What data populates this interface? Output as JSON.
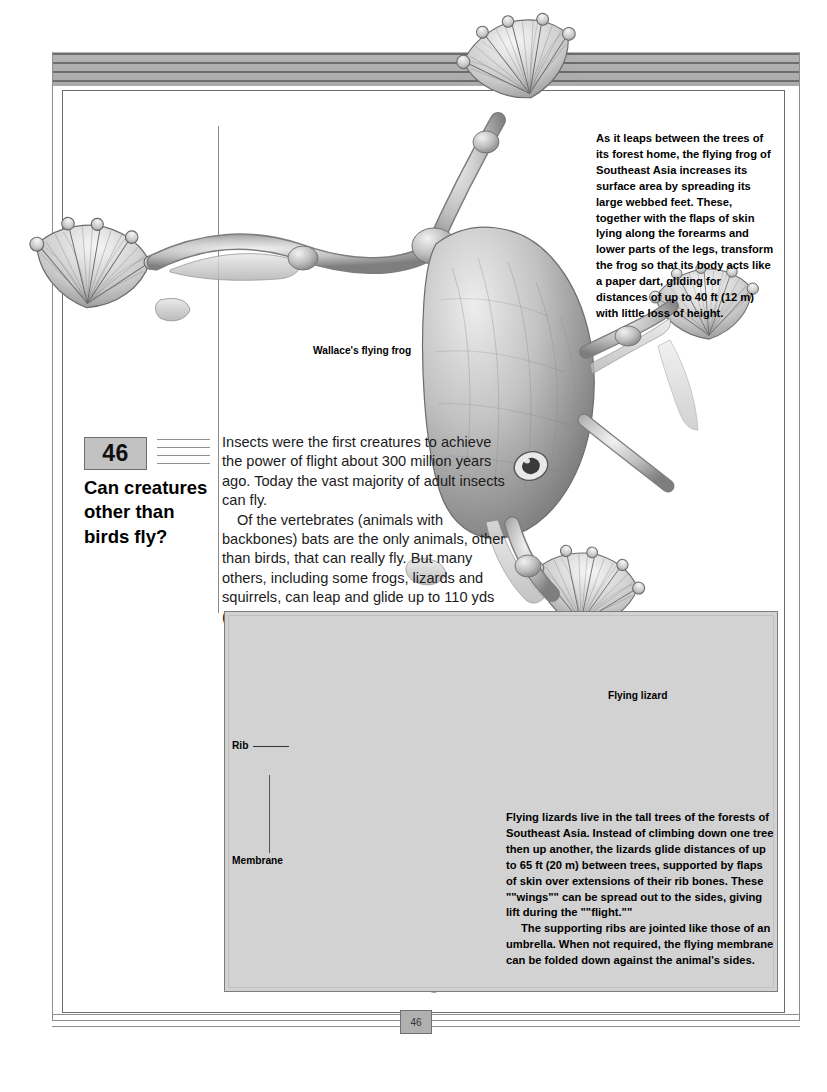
{
  "page": {
    "number": "46",
    "footer_number": "46"
  },
  "heading": {
    "number": "46",
    "title": "Can creatures other than birds fly?"
  },
  "body": {
    "paragraphs": [
      "Insects were the first creatures to achieve the power of flight about 300 million years ago. Today the vast majority of adult insects can fly.",
      "Of the vertebrates (animals with backbones) bats are the only animals, other than birds, that can really fly. But many others, including some frogs, lizards and squirrels, can leap and glide up to 110 yds (100 m)."
    ]
  },
  "frog_caption": {
    "text": "As it leaps between the trees of its forest home, the flying frog of Southeast Asia increases its surface area by spreading its large webbed feet. These, together with the flaps of skin lying along the forearms and lower parts of the legs, transform the frog so that its body acts like a paper dart, gliding for distances of up to 40 ft (12 m) with little loss of height."
  },
  "labels": {
    "frog": "Wallace's flying frog",
    "lizard": "Flying lizard",
    "rib": "Rib",
    "membrane": "Membrane"
  },
  "lizard_caption": {
    "paragraphs": [
      "Flying lizards live in the tall trees of the forests of Southeast Asia. Instead of climbing down one tree then up another, the lizards glide distances of up to 65 ft (20 m) between trees, supported by flaps of skin over extensions of their rib bones. These \"\"wings\"\" can be spread out to the sides, giving lift during the \"\"flight.\"\"",
      "The supporting ribs are jointed like those of an umbrella. When not required, the flying membrane can be folded down against the animal's sides."
    ]
  },
  "colors": {
    "header_band": "#aeaeae",
    "panel_bg": "#d2d2d2",
    "num_box_bg": "#c2c2c2",
    "rule": "#6e6e6e",
    "text": "#111111"
  }
}
